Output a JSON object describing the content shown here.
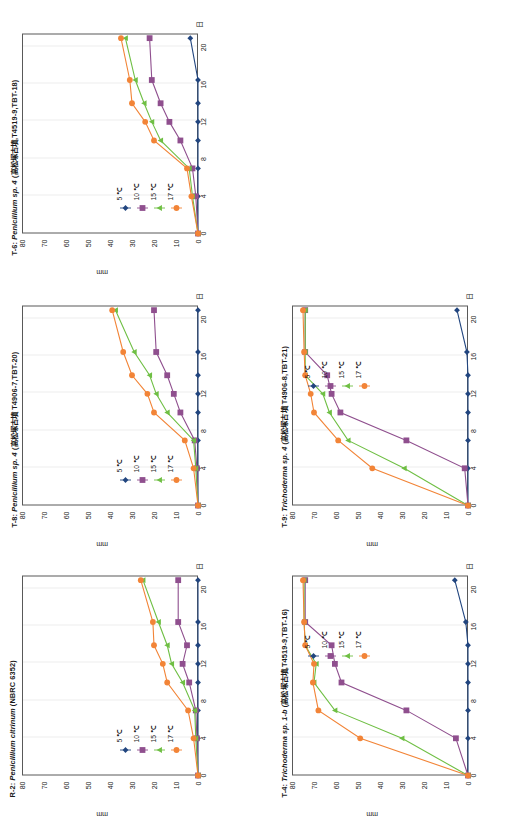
{
  "figure": {
    "axis": {
      "y_ticks": [
        0,
        10,
        20,
        30,
        40,
        50,
        60,
        70,
        80
      ],
      "y_label": "mm",
      "x_ticks": [
        0,
        4,
        8,
        12,
        16,
        20
      ],
      "x_label": "日",
      "ylim": [
        0,
        80
      ],
      "xlim": [
        0,
        21.5
      ],
      "grid": "vertical"
    },
    "series_names": [
      "5 ℃",
      "10 ℃",
      "15 ℃",
      "17 ℃"
    ],
    "series_colors": [
      "#21457f",
      "#8f4f8e",
      "#6fbf44",
      "#f28437"
    ],
    "series_markers": [
      "diamond",
      "square",
      "triangle",
      "circle"
    ]
  },
  "chart_data": [
    {
      "type": "line",
      "panel_id": "R-2",
      "title": "R-2: Penicillium citrinum (NBRC 6352)",
      "title_italic": "Penicillium citrinum",
      "title_prefix": "R-2: ",
      "title_suffix": " (NBRC 6352)",
      "xlabel": "日",
      "ylabel": "mm",
      "xlim": [
        0,
        21.5
      ],
      "ylim": [
        0,
        80
      ],
      "x": [
        0,
        4,
        7,
        10,
        12,
        14,
        16.5,
        21
      ],
      "categories": [
        "0",
        "4",
        "7",
        "10",
        "12",
        "14",
        "16.5",
        "21"
      ],
      "series": [
        {
          "name": "5 ℃",
          "values": [
            0,
            0,
            0,
            0,
            0,
            0,
            0,
            0
          ]
        },
        {
          "name": "10 ℃",
          "values": [
            0,
            0.5,
            1,
            4,
            7,
            5,
            9,
            9
          ]
        },
        {
          "name": "15 ℃",
          "values": [
            0,
            1,
            1.5,
            7,
            12,
            14,
            18,
            25
          ]
        },
        {
          "name": "17 ℃",
          "values": [
            0,
            2,
            4.5,
            14,
            16,
            20,
            20.5,
            26
          ]
        }
      ]
    },
    {
      "type": "line",
      "panel_id": "T-8",
      "title": "T-8: Penicillium sp. 4 (高松塚古墳  T4906-7,TBT-20)",
      "title_italic": "Penicillium sp. 4",
      "title_prefix": "T-8: ",
      "title_suffix": " (高松塚古墳  T4906-7,TBT-20)",
      "xlabel": "日",
      "ylabel": "mm",
      "xlim": [
        0,
        21.5
      ],
      "ylim": [
        0,
        80
      ],
      "x": [
        0,
        4,
        7,
        10,
        12,
        14,
        16.5,
        21
      ],
      "categories": [
        "0",
        "4",
        "7",
        "10",
        "12",
        "14",
        "16.5",
        "21"
      ],
      "series": [
        {
          "name": "5 ℃",
          "values": [
            0,
            0,
            0,
            0,
            0,
            0,
            0,
            0
          ]
        },
        {
          "name": "10 ℃",
          "values": [
            0,
            0.5,
            1.5,
            8,
            11,
            14,
            19,
            20
          ]
        },
        {
          "name": "15 ℃",
          "values": [
            0,
            1,
            2,
            14,
            19,
            22,
            29,
            37.5
          ]
        },
        {
          "name": "17 ℃",
          "values": [
            0,
            2,
            6,
            20,
            23,
            30,
            34,
            39
          ]
        }
      ]
    },
    {
      "type": "line",
      "panel_id": "T-6",
      "title": "T-6: Penicillium sp. 4 (高松塚古墳,T4519-9,TBT-18)",
      "title_italic": "Penicillium sp. 4",
      "title_prefix": "T-6: ",
      "title_suffix": " (高松塚古墳,T4519-9,TBT-18)",
      "xlabel": "日",
      "ylabel": "mm",
      "xlim": [
        0,
        21.5
      ],
      "ylim": [
        0,
        80
      ],
      "x": [
        0,
        4,
        7,
        10,
        12,
        14,
        16.5,
        21
      ],
      "categories": [
        "0",
        "4",
        "7",
        "10",
        "12",
        "14",
        "16.5",
        "21"
      ],
      "series": [
        {
          "name": "5 ℃",
          "values": [
            0,
            0,
            0,
            0,
            0,
            0,
            0,
            3.5
          ]
        },
        {
          "name": "10 ℃",
          "values": [
            0,
            1,
            2.5,
            8,
            13,
            17,
            21,
            22
          ]
        },
        {
          "name": "15 ℃",
          "values": [
            0,
            2.5,
            4,
            17,
            21,
            24.5,
            28.5,
            33
          ]
        },
        {
          "name": "17 ℃",
          "values": [
            0,
            3,
            5,
            20,
            24,
            30,
            31,
            35
          ]
        }
      ]
    },
    {
      "type": "line",
      "panel_id": "T-9",
      "title": "T-9: Trichoderma sp. 4 (高松塚古墳  T4906-8,TBT-21)",
      "title_italic": "Trichoderma sp. 4",
      "title_prefix": "T-9: ",
      "title_suffix": " (高松塚古墳  T4906-8,TBT-21)",
      "xlabel": "日",
      "ylabel": "mm",
      "xlim": [
        0,
        21.5
      ],
      "ylim": [
        0,
        80
      ],
      "x": [
        0,
        4,
        7,
        10,
        12,
        14,
        16.5,
        21
      ],
      "categories": [
        "0",
        "4",
        "7",
        "10",
        "12",
        "14",
        "16.5",
        "21"
      ],
      "series": [
        {
          "name": "5 ℃",
          "values": [
            0,
            0,
            0,
            0,
            0,
            0,
            0.5,
            5
          ]
        },
        {
          "name": "10 ℃",
          "values": [
            0,
            1.5,
            28,
            58,
            62,
            64,
            74,
            74
          ]
        },
        {
          "name": "15 ℃",
          "values": [
            0,
            29,
            54.5,
            63,
            66,
            74,
            74,
            74
          ]
        },
        {
          "name": "17 ℃",
          "values": [
            0,
            43.5,
            59,
            70,
            71.5,
            74,
            74.5,
            75
          ]
        }
      ]
    },
    {
      "type": "line",
      "panel_id": "T-4",
      "title": "T-4: Trichoderma sp. 1-b (高松塚古墳,T4519-9,TBT-16)",
      "title_italic": "Trichoderma sp. 1-b",
      "title_prefix": "T-4: ",
      "title_suffix": " (高松塚古墳,T4519-9,TBT-16)",
      "xlabel": "日",
      "ylabel": "mm",
      "xlim": [
        0,
        21.5
      ],
      "ylim": [
        0,
        80
      ],
      "x": [
        0,
        4,
        7,
        10,
        12,
        14,
        16.5,
        21
      ],
      "categories": [
        "0",
        "4",
        "7",
        "10",
        "12",
        "14",
        "16.5",
        "21"
      ],
      "series": [
        {
          "name": "5 ℃",
          "values": [
            0,
            0,
            0,
            0,
            0,
            0,
            1,
            6
          ]
        },
        {
          "name": "10 ℃",
          "values": [
            0,
            5.5,
            28,
            57.5,
            60.5,
            62,
            74,
            74
          ]
        },
        {
          "name": "15 ℃",
          "values": [
            0,
            30,
            60.5,
            70,
            69,
            74,
            74.5,
            74.5
          ]
        },
        {
          "name": "17 ℃",
          "values": [
            0,
            49,
            68,
            70.5,
            70,
            74,
            74.5,
            75
          ]
        }
      ]
    }
  ]
}
